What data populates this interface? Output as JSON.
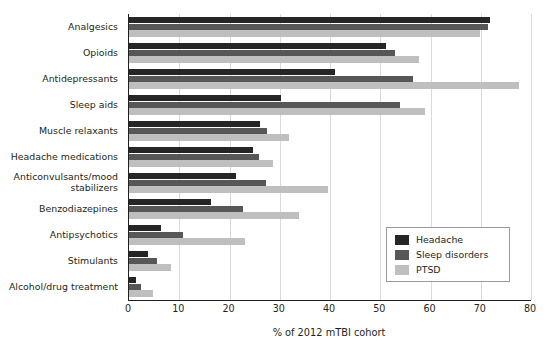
{
  "chart_data": {
    "type": "bar",
    "orientation": "horizontal",
    "title": "",
    "xlabel": "% of 2012 mTBI cohort",
    "ylabel": "",
    "xlim": [
      0,
      80
    ],
    "xticks": [
      0,
      10,
      20,
      30,
      40,
      50,
      60,
      70,
      80
    ],
    "grid": "vertical",
    "legend_position": "lower-right",
    "categories": [
      "Analgesics",
      "Opioids",
      "Antidepressants",
      "Sleep aids",
      "Muscle relaxants",
      "Headache medications",
      "Anticonvulsants/mood stabilizers",
      "Benzodiazepines",
      "Antipsychotics",
      "Stimulants",
      "Alcohol/drug treatment"
    ],
    "series": [
      {
        "name": "Headache",
        "color": "#262626",
        "values": [
          71.8,
          51.2,
          41.0,
          30.2,
          26.0,
          24.7,
          21.3,
          16.3,
          6.4,
          3.8,
          1.4
        ]
      },
      {
        "name": "Sleep disorders",
        "color": "#575757",
        "values": [
          71.4,
          53.0,
          56.5,
          54.0,
          27.5,
          25.9,
          27.3,
          22.7,
          10.7,
          5.6,
          2.4
        ]
      },
      {
        "name": "PTSD",
        "color": "#bfbfbf",
        "values": [
          69.8,
          57.7,
          77.6,
          59.0,
          31.8,
          28.7,
          39.6,
          33.8,
          23.1,
          8.4,
          4.8
        ]
      }
    ]
  },
  "legend": {
    "items": [
      {
        "label": "Headache",
        "color": "#262626"
      },
      {
        "label": "Sleep disorders",
        "color": "#575757"
      },
      {
        "label": "PTSD",
        "color": "#bfbfbf"
      }
    ]
  }
}
